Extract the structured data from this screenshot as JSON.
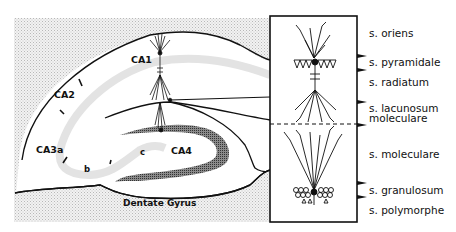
{
  "figure": {
    "region_labels": {
      "ca1": "CA1",
      "ca2": "CA2",
      "ca3a": "CA3a",
      "ca3b": "b",
      "ca3c": "c",
      "ca4": "CA4",
      "dentate_gyrus": "Dentate Gyrus"
    },
    "strata": [
      {
        "label": "s. oriens"
      },
      {
        "label": "s. pyramidale"
      },
      {
        "label": "s. radiatum"
      },
      {
        "label": "s. lacunosum",
        "label2": "moleculare"
      },
      {
        "label": "s. moleculare"
      },
      {
        "label": "s. granulosum"
      },
      {
        "label": "s. polymorphe"
      }
    ],
    "colors": {
      "ink": "#111111",
      "stipple": "#d9d9d9",
      "pyramidal_band": "#e6e6e6",
      "granule_band": "#6a6a6a"
    }
  }
}
